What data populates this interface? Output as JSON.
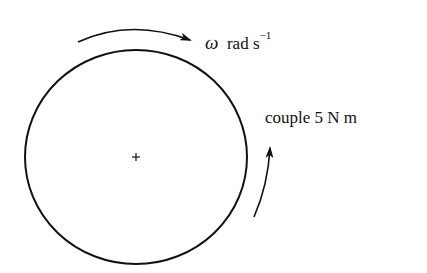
{
  "diagram": {
    "type": "rotating-disc",
    "angular_velocity": {
      "symbol": "ω",
      "unit": "rad s",
      "exponent": "−1"
    },
    "couple": {
      "label": "couple 5 N m"
    },
    "center_marker": "+",
    "colors": {
      "stroke": "#111111",
      "background": "#ffffff"
    }
  }
}
